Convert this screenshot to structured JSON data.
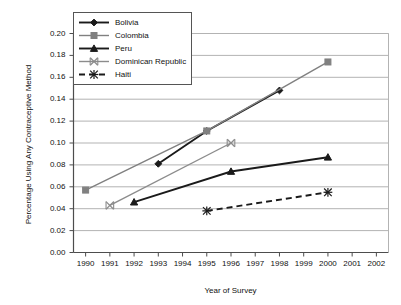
{
  "chart_data": {
    "type": "line",
    "title": "",
    "xlabel": "Year of Survey",
    "ylabel": "Percentage Using Any Contraceptive Method",
    "xlim": [
      1989.5,
      2002.5
    ],
    "ylim": [
      0.0,
      0.2
    ],
    "grid": "horizontal",
    "legend_position": "top-left-inside",
    "xticks": [
      "1990",
      "1991",
      "1992",
      "1993",
      "1994",
      "1995",
      "1996",
      "1997",
      "1998",
      "1999",
      "2000",
      "2001",
      "2002"
    ],
    "yticks": [
      "0.00",
      "0.02",
      "0.04",
      "0.06",
      "0.08",
      "0.10",
      "0.12",
      "0.14",
      "0.16",
      "0.18",
      "0.20"
    ],
    "series": [
      {
        "name": "Bolivia",
        "color": "#1a1a1a",
        "marker": "diamond",
        "dash": "solid",
        "x": [
          1993,
          1995,
          1998
        ],
        "values": [
          0.081,
          0.111,
          0.148
        ]
      },
      {
        "name": "Colombia",
        "color": "#808080",
        "marker": "square",
        "dash": "solid",
        "x": [
          1990,
          1995,
          2000
        ],
        "values": [
          0.057,
          0.111,
          0.174
        ]
      },
      {
        "name": "Peru",
        "color": "#1a1a1a",
        "marker": "triangle",
        "dash": "solid",
        "x": [
          1992,
          1996,
          2000
        ],
        "values": [
          0.046,
          0.074,
          0.087
        ]
      },
      {
        "name": "Dominican Republic",
        "color": "#8c8c8c",
        "marker": "x-cross",
        "dash": "solid",
        "x": [
          1991,
          1996
        ],
        "values": [
          0.043,
          0.1
        ]
      },
      {
        "name": "Haiti",
        "color": "#1a1a1a",
        "marker": "asterisk",
        "dash": "dashed",
        "x": [
          1995,
          2000
        ],
        "values": [
          0.038,
          0.055
        ]
      }
    ]
  },
  "legend": {
    "items": [
      {
        "label": "Bolivia"
      },
      {
        "label": "Colombia"
      },
      {
        "label": "Peru"
      },
      {
        "label": "Dominican Republic"
      },
      {
        "label": "Haiti"
      }
    ]
  },
  "axes": {
    "x_title": "Year of Survey",
    "y_title": "Percentage Using Any Contraceptive Method",
    "x_tick_labels": [
      "1990",
      "1991",
      "1992",
      "1993",
      "1994",
      "1995",
      "1996",
      "1997",
      "1998",
      "1999",
      "2000",
      "2001",
      "2002"
    ],
    "y_tick_labels": [
      "0.00",
      "0.02",
      "0.04",
      "0.06",
      "0.08",
      "0.10",
      "0.12",
      "0.14",
      "0.16",
      "0.18",
      "0.20"
    ]
  },
  "colors": {
    "axis": "#4d4d4d",
    "grid": "#b3b3b3",
    "dark_series": "#1a1a1a",
    "gray_series": "#808080",
    "light_gray_series": "#8c8c8c",
    "text": "#111111"
  }
}
